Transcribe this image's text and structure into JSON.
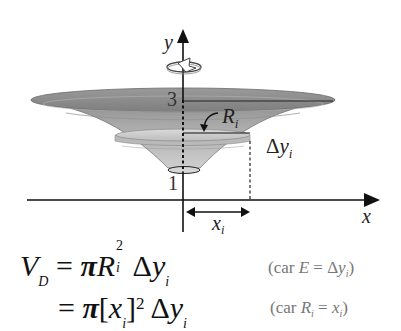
{
  "diagram": {
    "axes": {
      "y_label": "y",
      "x_label": "x",
      "tick_top": "3",
      "tick_bottom": "1"
    },
    "labels": {
      "radius": "R",
      "radius_sub": "i",
      "thickness_delta": "Δ",
      "thickness_var": "y",
      "thickness_sub": "i",
      "x_var": "x",
      "x_sub": "i"
    },
    "rotation_icon": "rotation-arrow-around-y-axis",
    "colors": {
      "solid_dark": "#8a8a8a",
      "solid_mid": "#a6a6a6",
      "solid_light": "#c8c8c8",
      "disk": "#d4d4d4",
      "axis": "#111111",
      "note_text": "#777777"
    }
  },
  "equations": {
    "line1": {
      "lhs_var": "V",
      "lhs_sub": "D",
      "equals": "=",
      "pi": "π",
      "R": "R",
      "R_sup": "2",
      "R_sub": "i",
      "delta": "Δ",
      "y": "y",
      "y_sub": "i",
      "note_open": "(car ",
      "note_var": "E",
      "note_eq": " = Δ",
      "note_y": "y",
      "note_sub": "i",
      "note_close": ")"
    },
    "line2": {
      "equals": "=",
      "pi": "π",
      "bracket_open": "[",
      "x": "x",
      "x_sub": "i",
      "bracket_close": "]",
      "sup": "2",
      "delta": "Δ",
      "y": "y",
      "y_sub": "i",
      "note_open": "(car ",
      "note_var": "R",
      "note_var_sub": "i",
      "note_eq": " = ",
      "note_x": "x",
      "note_x_sub": "i",
      "note_close": ")"
    }
  }
}
